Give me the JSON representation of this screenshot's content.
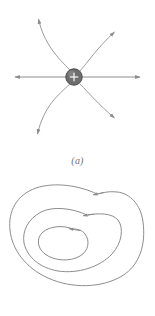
{
  "figure": {
    "background_color": "#ffffff",
    "line_color": "#8d8d8d",
    "line_color_light": "#9b9b9b",
    "charge_fill_color": "#6e6e6e",
    "charge_stroke_color": "#4a4a4a",
    "caption_color": "#6f6f6f"
  },
  "panels": [
    {
      "id": "a",
      "caption": "(a)",
      "description": "Electric field lines radiating from a positive point charge",
      "charge": {
        "symbol": "+",
        "sign": "positive",
        "center_x": 74,
        "center_y": 77,
        "radius": 8
      },
      "field_lines": [
        {
          "name": "field-line-left",
          "direction": "left",
          "arrow_x": 13,
          "arrow_y": 77,
          "shape": "straight"
        },
        {
          "name": "field-line-right",
          "direction": "right",
          "arrow_x": 142,
          "arrow_y": 77,
          "shape": "straight"
        },
        {
          "name": "field-line-upper-left",
          "direction": "up-left",
          "arrow_x": 38,
          "arrow_y": 16,
          "shape": "curved"
        },
        {
          "name": "field-line-upper-right",
          "direction": "up-right",
          "arrow_x": 117,
          "arrow_y": 30,
          "shape": "curved"
        },
        {
          "name": "field-line-lower-left",
          "direction": "down-left",
          "arrow_x": 37,
          "arrow_y": 137,
          "shape": "curved"
        },
        {
          "name": "field-line-lower-right",
          "direction": "down-right",
          "arrow_x": 117,
          "arrow_y": 120,
          "shape": "curved"
        }
      ]
    },
    {
      "id": "b",
      "caption": "(b)",
      "description": "Three nested closed field loops with directional arrowheads",
      "loops": [
        {
          "name": "loop-outer",
          "arrow_x": 97,
          "arrow_y": 22,
          "arrow_direction": "left"
        },
        {
          "name": "loop-middle",
          "arrow_x": 87,
          "arrow_y": 43,
          "arrow_direction": "left"
        },
        {
          "name": "loop-inner",
          "arrow_x": 73,
          "arrow_y": 57,
          "arrow_direction": "left"
        }
      ]
    }
  ]
}
